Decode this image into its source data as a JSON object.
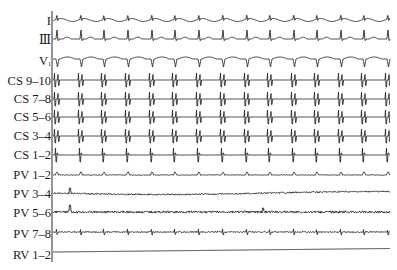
{
  "figure": {
    "type": "intracardiac-electrogram",
    "axis": {
      "x": 52,
      "y_top": 11,
      "y_bottom": 262
    },
    "trace_x_start": 53,
    "trace_x_end": 390,
    "beat_positions": [
      57,
      81,
      104,
      128,
      152,
      175,
      199,
      223,
      247,
      270,
      294,
      317,
      341,
      364,
      388
    ],
    "channels": [
      {
        "label": "I",
        "baseline": 20,
        "label_y": 21,
        "wave": "surface_small"
      },
      {
        "label": "Ⅲ",
        "baseline": 39,
        "label_y": 40,
        "wave": "surface_tall"
      },
      {
        "label": "V",
        "sub": "1",
        "baseline": 59,
        "label_y": 61,
        "wave": "surface_neg"
      },
      {
        "label": "CS 9–10",
        "baseline": 80,
        "label_y": 81,
        "wave": "cs_double"
      },
      {
        "label": "CS 7–8",
        "baseline": 99,
        "label_y": 99,
        "wave": "cs_double"
      },
      {
        "label": "CS 5–6",
        "baseline": 117,
        "label_y": 117,
        "wave": "cs_double"
      },
      {
        "label": "CS 3–4",
        "baseline": 136,
        "label_y": 136,
        "wave": "cs_double"
      },
      {
        "label": "CS 1–2",
        "baseline": 155,
        "label_y": 155,
        "wave": "cs_single"
      },
      {
        "label": "PV 1–2",
        "baseline": 175,
        "label_y": 175,
        "wave": "pv_bump"
      },
      {
        "label": "PV 3–4",
        "baseline": 193,
        "label_y": 194,
        "wave": "pv_noise"
      },
      {
        "label": "PV 5–6",
        "baseline": 212,
        "label_y": 213,
        "wave": "pv_noise_big"
      },
      {
        "label": "PV 7–8",
        "baseline": 232,
        "label_y": 234,
        "wave": "pv_small"
      },
      {
        "label": "RV 1–2",
        "baseline": 252,
        "label_y": 255,
        "wave": "flat"
      }
    ],
    "colors": {
      "trace": "#2a2a2a",
      "label": "#1a1a1a",
      "background": "#ffffff"
    }
  }
}
